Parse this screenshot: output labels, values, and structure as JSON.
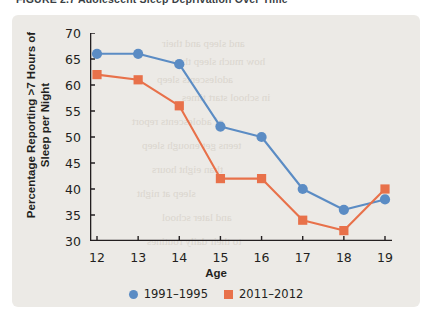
{
  "figure": {
    "caption": "FIGURE 2.7   Adolescent Sleep Deprivation Over Time"
  },
  "colors": {
    "panel_background": "#eceae6",
    "series_1991_1995": "#5b8cc4",
    "series_2011_2012": "#e8714a",
    "axis": "#231f20",
    "bleed_text": "#d8d3cb"
  },
  "legend": {
    "position": "bottom-center",
    "entries": [
      {
        "label": "1991–1995",
        "marker": "circle",
        "color": "#5b8cc4"
      },
      {
        "label": "2011–2012",
        "marker": "square",
        "color": "#e8714a"
      }
    ]
  },
  "bleed_text_lines": [
    "and sleep and their",
    "how much sleep they",
    "adolescents sleep",
    "in school start times",
    "of adolescents report",
    "teens get enough sleep",
    "than eight hours",
    "sleep at night",
    "and later school",
    "to their daily routines"
  ],
  "chart_data": {
    "type": "line",
    "title": "",
    "xlabel": "Age",
    "ylabel": "Percentage Reporting >7 Hours of Sleep per Night",
    "ylabel_lines": [
      "Percentage Reporting >7 Hours of",
      "Sleep per Night"
    ],
    "categories": [
      12,
      13,
      14,
      15,
      16,
      17,
      18,
      19
    ],
    "x": [
      12,
      13,
      14,
      15,
      16,
      17,
      18,
      19
    ],
    "xlim": [
      12,
      19
    ],
    "ylim": [
      30,
      70
    ],
    "ytick_step": 5,
    "yticks": [
      30,
      35,
      40,
      45,
      50,
      55,
      60,
      65,
      70
    ],
    "xticks": [
      12,
      13,
      14,
      15,
      16,
      17,
      18,
      19
    ],
    "grid": false,
    "series": [
      {
        "name": "1991–1995",
        "color": "#5b8cc4",
        "marker": "circle",
        "values": [
          66,
          66,
          64,
          52,
          50,
          40,
          36,
          38
        ]
      },
      {
        "name": "2011–2012",
        "color": "#e8714a",
        "marker": "square",
        "values": [
          62,
          61,
          56,
          42,
          42,
          34,
          32,
          40
        ]
      }
    ]
  }
}
